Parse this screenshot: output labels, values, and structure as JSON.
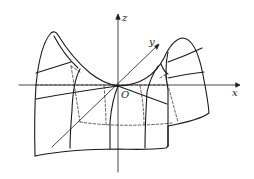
{
  "diagram": {
    "type": "saddle-surface",
    "axes": {
      "x_label": "x",
      "y_label": "y",
      "z_label": "z",
      "origin_label": "O"
    },
    "colors": {
      "stroke": "#1a1a1a",
      "background": "#ffffff"
    }
  }
}
